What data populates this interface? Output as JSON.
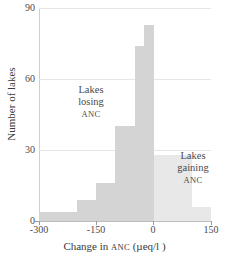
{
  "chart_data": {
    "type": "bar",
    "title": "",
    "subtitle": "",
    "xlabel_parts": {
      "pre": "Change in ",
      "smallcaps": "ANC",
      "post": " (µeq/l )"
    },
    "xlabel": "Change in ANC (µeq/l )",
    "ylabel": "Number of lakes",
    "xlim": [
      -300,
      150
    ],
    "ylim": [
      0,
      90
    ],
    "xticks": [
      -300,
      -150,
      0,
      150
    ],
    "xtick_labels": [
      "-300",
      "-150",
      "0",
      "150"
    ],
    "yticks": [
      0,
      30,
      60,
      90
    ],
    "ytick_labels": [
      "0",
      "30",
      "60",
      "90"
    ],
    "grid": "horizontal",
    "legend": "none",
    "bin_edges": [
      -300,
      -250,
      -200,
      -150,
      -100,
      -50,
      -25,
      0,
      50,
      100,
      150
    ],
    "values": [
      4,
      4,
      9,
      16,
      40,
      74,
      83,
      28,
      28,
      6
    ],
    "bin_labels": [
      "-300 to -250",
      "-250 to -200",
      "-200 to -150",
      "-150 to -100",
      "-100 to -50",
      "-50 to -25",
      "-25 to 0",
      "0 to 50",
      "50 to 100",
      "100 to 150"
    ],
    "bar_colors": [
      "#d4d4d4",
      "#d4d4d4",
      "#d4d4d4",
      "#d4d4d4",
      "#d4d4d4",
      "#d4d4d4",
      "#d4d4d4",
      "#e8e8e8",
      "#e8e8e8",
      "#e8e8e8"
    ],
    "colors": {
      "losing_bars": "#d4d4d4",
      "gaining_bars": "#e8e8e8",
      "gridline": "#e6e6e6",
      "axis": "#bdbdbd",
      "text": "#3a3a3a",
      "background": "#ffffff"
    },
    "annotations": [
      {
        "name": "lakes-losing",
        "lines": [
          "Lakes",
          "losing",
          "ANC"
        ],
        "smallcaps_line_index": 2,
        "x_data": -110,
        "y_data": 52
      },
      {
        "name": "lakes-gaining",
        "lines": [
          "Lakes",
          "gaining",
          "ANC"
        ],
        "smallcaps_line_index": 2,
        "x_data": 75,
        "y_data": 30
      }
    ]
  }
}
